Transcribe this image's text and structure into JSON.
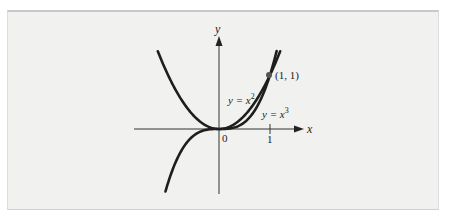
{
  "chart_data": {
    "type": "line",
    "title": "",
    "xlabel": "x",
    "ylabel": "y",
    "xlim": [
      -1.67,
      1.63
    ],
    "ylim": [
      -1.2,
      1.7
    ],
    "grid": false,
    "origin_label": "0",
    "x_ticks": [
      {
        "value": 1,
        "label": "1"
      }
    ],
    "series": [
      {
        "name": "y = x^2",
        "label_text": "y = x",
        "exponent": "2",
        "domain": [
          -1.2,
          1.2
        ]
      },
      {
        "name": "y = x^3",
        "label_text": "y = x",
        "exponent": "3",
        "domain": [
          -1.05,
          1.13
        ]
      }
    ],
    "annotations": [
      {
        "type": "point",
        "x": 1,
        "y": 1,
        "label": "(1, 1)"
      }
    ]
  },
  "colors": {
    "curve": "#1e1e1e",
    "axis": "#333333",
    "point": "#555555",
    "panel_bg": "#f1f1f0"
  }
}
